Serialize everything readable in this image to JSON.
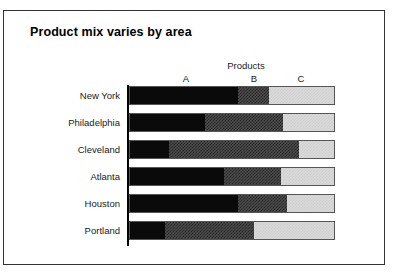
{
  "chart_data": {
    "type": "bar",
    "subtype": "stacked-horizontal-100pct",
    "title": "Product mix varies by area",
    "legend_title": "Products",
    "legend_position": "top",
    "xlabel": "",
    "ylabel": "",
    "grid": false,
    "xlim": [
      0,
      100
    ],
    "categories": [
      "New York",
      "Philadelphia",
      "Cleveland",
      "Atlanta",
      "Houston",
      "Portland"
    ],
    "series": [
      {
        "name": "A",
        "values": [
          53,
          37,
          19,
          46,
          53,
          17
        ]
      },
      {
        "name": "B",
        "values": [
          15,
          38,
          64,
          28,
          24,
          44
        ]
      },
      {
        "name": "C",
        "values": [
          32,
          25,
          17,
          26,
          23,
          39
        ]
      }
    ],
    "segment_labels": [
      "A",
      "B",
      "C"
    ],
    "colors": {
      "A": "#0a0a0a",
      "B": "#4a4a4a",
      "C": "#d9d9d9",
      "border": "#555555",
      "axis": "#000000",
      "frame": "#333333",
      "text": "#1a1a1a",
      "background": "#ffffff"
    }
  },
  "figure": {
    "title": "Product mix varies by area",
    "legend_title": "Products"
  }
}
